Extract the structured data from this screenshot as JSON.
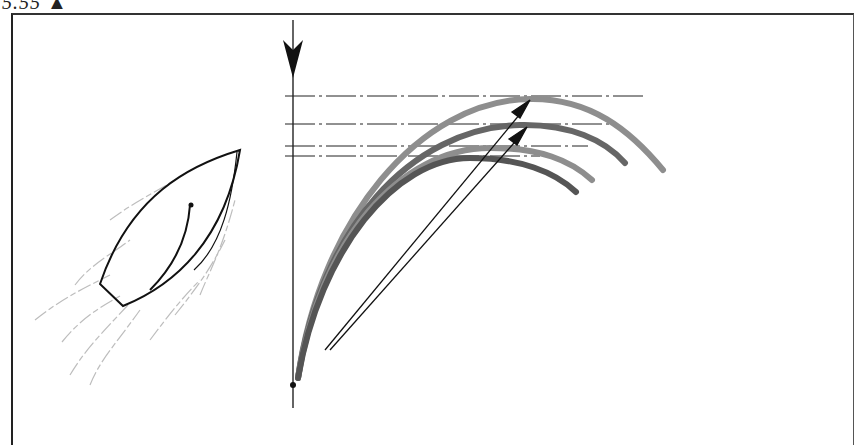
{
  "figure": {
    "label": "5.55",
    "label_marker": "triangle-up",
    "colors": {
      "ink": "#111111",
      "curve_light": "#8a8a8a",
      "curve_mid": "#6a6a6a",
      "curve_dark": "#555555",
      "wake": "#bdbdbd",
      "frame": "#333333"
    },
    "guides": [
      {
        "y": 96,
        "x2": 645
      },
      {
        "y": 124,
        "x2": 612
      },
      {
        "y": 146,
        "x2": 588
      },
      {
        "y": 156,
        "x2": 540
      }
    ]
  }
}
